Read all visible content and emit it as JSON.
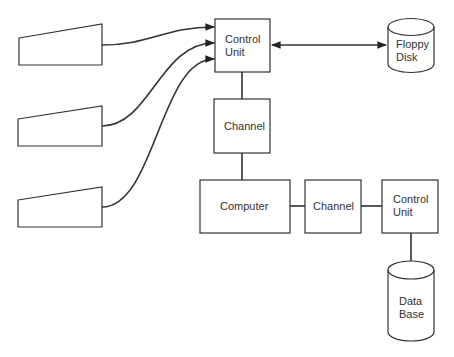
{
  "diagram": {
    "stroke_color": "#333333",
    "background": "#ffffff",
    "terminals": [
      {
        "id": "terminal-1"
      },
      {
        "id": "terminal-2"
      },
      {
        "id": "terminal-3"
      }
    ],
    "boxes": {
      "control_unit_top": "Control\nUnit",
      "channel_top": "Channel",
      "computer": "Computer",
      "channel_right": "Channel",
      "control_unit_right": "Control\nUnit"
    },
    "storage": {
      "floppy_disk": "Floppy\nDisk",
      "data_base": "Data\nBase"
    },
    "caption": ""
  }
}
